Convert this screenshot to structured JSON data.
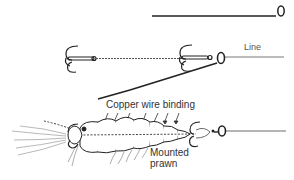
{
  "diagram": {
    "stages": [
      {
        "name": "baiting-needle",
        "description": "Straight wire needle with eye"
      },
      {
        "name": "hook-trace",
        "description": "Two treble hooks on a wire trace, threaded on needle"
      },
      {
        "name": "mounted-prawn",
        "description": "Prawn bound to trace with copper wire"
      }
    ],
    "labels": {
      "line": "Line",
      "copper_wire": "Copper wire binding",
      "mounted_prawn_1": "Mounted",
      "mounted_prawn_2": "prawn"
    },
    "colors": {
      "ink": "#222222",
      "light_ink": "#777777",
      "background": "#ffffff"
    }
  }
}
